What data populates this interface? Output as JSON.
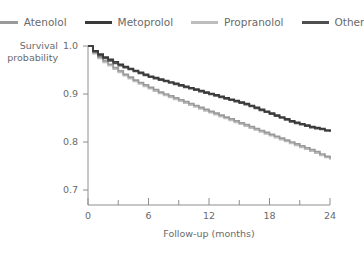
{
  "chart_data": {
    "type": "line",
    "subtype": "kaplan-meier-step",
    "title": "",
    "xlabel": "Follow-up (months)",
    "ylabel": "Survival probability",
    "xlim": [
      0,
      24
    ],
    "ylim": [
      0.7,
      1.0
    ],
    "xticks": [
      0,
      6,
      12,
      18,
      24
    ],
    "xticklabels": [
      "0",
      "6",
      "12",
      "18",
      "24"
    ],
    "xminorticks": [
      3,
      9,
      15,
      21
    ],
    "yticks": [
      0.7,
      0.8,
      0.9,
      1.0
    ],
    "yticklabels": [
      "0.7",
      "0.8",
      "0.9",
      "1.0"
    ],
    "grid": false,
    "legend_position": "top",
    "x": [
      0,
      0.5,
      1,
      1.5,
      2,
      2.5,
      3,
      3.5,
      4,
      4.5,
      5,
      5.5,
      6,
      6.5,
      7,
      7.5,
      8,
      8.5,
      9,
      9.5,
      10,
      10.5,
      11,
      11.5,
      12,
      12.5,
      13,
      13.5,
      14,
      14.5,
      15,
      15.5,
      16,
      16.5,
      17,
      17.5,
      18,
      18.5,
      19,
      19.5,
      20,
      20.5,
      21,
      21.5,
      22,
      22.5,
      23,
      23.5,
      24
    ],
    "series": [
      {
        "name": "Atenolol",
        "color": "#9a9a9a",
        "values": [
          1.0,
          0.986,
          0.977,
          0.969,
          0.962,
          0.955,
          0.948,
          0.941,
          0.935,
          0.929,
          0.924,
          0.919,
          0.914,
          0.909,
          0.904,
          0.9,
          0.896,
          0.892,
          0.888,
          0.884,
          0.88,
          0.876,
          0.872,
          0.868,
          0.864,
          0.86,
          0.856,
          0.852,
          0.848,
          0.844,
          0.84,
          0.836,
          0.832,
          0.828,
          0.824,
          0.82,
          0.816,
          0.812,
          0.808,
          0.804,
          0.8,
          0.796,
          0.792,
          0.788,
          0.784,
          0.78,
          0.775,
          0.77,
          0.765
        ]
      },
      {
        "name": "Metoprolol",
        "color": "#3a3a3a",
        "values": [
          1.0,
          0.99,
          0.983,
          0.977,
          0.972,
          0.967,
          0.962,
          0.957,
          0.953,
          0.949,
          0.945,
          0.941,
          0.937,
          0.934,
          0.931,
          0.928,
          0.925,
          0.922,
          0.919,
          0.916,
          0.913,
          0.91,
          0.907,
          0.904,
          0.901,
          0.898,
          0.895,
          0.892,
          0.889,
          0.886,
          0.883,
          0.88,
          0.876,
          0.872,
          0.868,
          0.864,
          0.86,
          0.856,
          0.852,
          0.848,
          0.844,
          0.841,
          0.838,
          0.835,
          0.832,
          0.83,
          0.828,
          0.825,
          0.823
        ]
      },
      {
        "name": "Propranolol",
        "color": "#bdbdbd",
        "values": [
          1.0,
          0.984,
          0.974,
          0.966,
          0.959,
          0.952,
          0.945,
          0.938,
          0.932,
          0.926,
          0.921,
          0.916,
          0.911,
          0.906,
          0.901,
          0.897,
          0.893,
          0.889,
          0.885,
          0.881,
          0.877,
          0.873,
          0.869,
          0.865,
          0.861,
          0.857,
          0.853,
          0.849,
          0.845,
          0.841,
          0.837,
          0.833,
          0.829,
          0.825,
          0.821,
          0.817,
          0.813,
          0.809,
          0.805,
          0.801,
          0.797,
          0.793,
          0.789,
          0.785,
          0.781,
          0.777,
          0.772,
          0.768,
          0.763
        ]
      },
      {
        "name": "Other",
        "color": "#4f4f4f",
        "values": [
          1.0,
          0.988,
          0.98,
          0.974,
          0.969,
          0.964,
          0.959,
          0.955,
          0.951,
          0.947,
          0.943,
          0.939,
          0.935,
          0.932,
          0.929,
          0.926,
          0.923,
          0.92,
          0.917,
          0.914,
          0.911,
          0.908,
          0.905,
          0.902,
          0.899,
          0.896,
          0.893,
          0.89,
          0.887,
          0.884,
          0.881,
          0.878,
          0.874,
          0.87,
          0.866,
          0.862,
          0.858,
          0.854,
          0.85,
          0.846,
          0.842,
          0.839,
          0.836,
          0.833,
          0.83,
          0.828,
          0.826,
          0.823,
          0.821
        ]
      }
    ]
  },
  "legend": {
    "items": [
      {
        "label": "Atenolol",
        "color": "#9a9a9a"
      },
      {
        "label": "Metoprolol",
        "color": "#3a3a3a"
      },
      {
        "label": "Propranolol",
        "color": "#bdbdbd"
      },
      {
        "label": "Other",
        "color": "#4f4f4f"
      }
    ]
  },
  "axes": {
    "ylabel_line1": "Survival",
    "ylabel_line2": "probability",
    "xlabel": "Follow-up (months)"
  }
}
